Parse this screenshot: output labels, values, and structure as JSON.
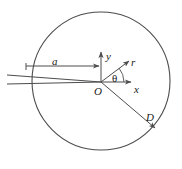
{
  "figure": {
    "type": "scientific-diagram",
    "background_color": "#ffffff",
    "stroke_color": "#4d4d4d",
    "text_color": "#1a1a1a",
    "circle": {
      "label": "boundary-circle",
      "center_x": 101,
      "center_y": 81,
      "radius": 69
    },
    "origin": {
      "x": 101,
      "y": 82
    },
    "labels": {
      "impact_parameter": "a",
      "y_axis": "y",
      "radial_vector": "r",
      "angle": "θ",
      "x_axis": "x",
      "origin": "O",
      "distance": "D"
    },
    "axes": {
      "y_axis": {
        "from_x": 101,
        "from_y": 82,
        "to_x": 101,
        "to_y": 50
      },
      "x_axis": {
        "from_x": 101,
        "from_y": 82,
        "to_x": 133,
        "to_y": 82
      }
    },
    "vectors": {
      "r_vector": {
        "from_x": 101,
        "from_y": 82,
        "to_x": 131,
        "to_y": 60,
        "angle_deg": 36
      },
      "d_vector": {
        "from_x": 101,
        "from_y": 82,
        "to_x": 157,
        "to_y": 130
      },
      "a_arrow": {
        "from_x": 33,
        "from_y": 66,
        "to_x": 100,
        "to_y": 66
      }
    },
    "incident_rays": [
      {
        "name": "ray-upper",
        "from_x": 12,
        "from_y": 75,
        "to_x": 101,
        "to_y": 82
      },
      {
        "name": "ray-lower",
        "from_x": 12,
        "from_y": 84,
        "to_x": 101,
        "to_y": 82
      }
    ],
    "arrow_head_size": 4
  }
}
